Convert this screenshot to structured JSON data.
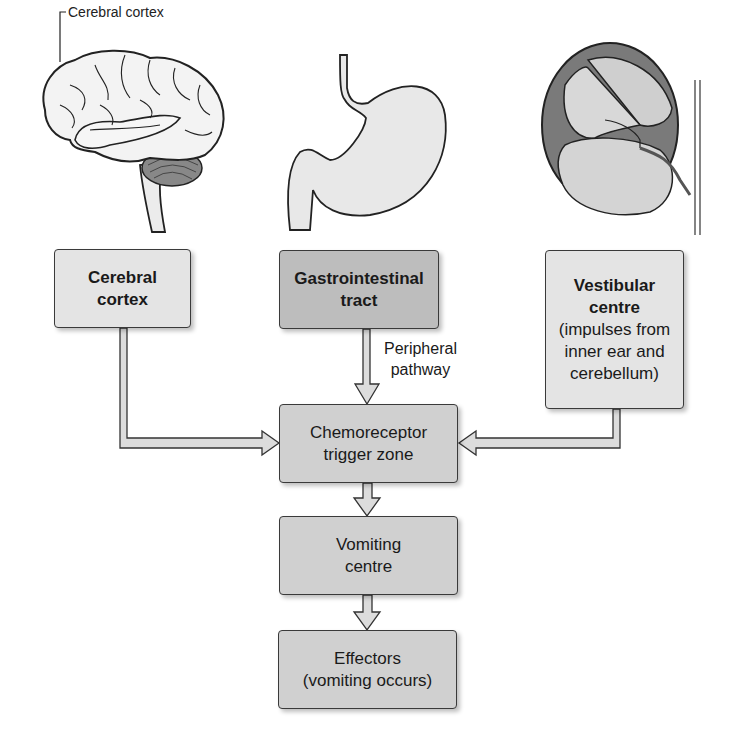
{
  "illustrations": {
    "brain": {
      "label": "Cerebral cortex"
    },
    "stomach": {},
    "inner_ear": {}
  },
  "boxes": {
    "cerebral_cortex": {
      "title_line1": "Cerebral",
      "title_line2": "cortex"
    },
    "gi_tract": {
      "title_line1": "Gastrointestinal",
      "title_line2": "tract"
    },
    "vestibular": {
      "title_line1": "Vestibular",
      "title_line2": "centre",
      "desc_line1": "(impulses from",
      "desc_line2": "inner ear and",
      "desc_line3": "cerebellum)"
    },
    "chemoreceptor": {
      "line1": "Chemoreceptor",
      "line2": "trigger zone"
    },
    "vomiting_centre": {
      "line1": "Vomiting",
      "line2": "centre"
    },
    "effectors": {
      "line1": "Effectors",
      "line2": "(vomiting occurs)"
    }
  },
  "arrow_labels": {
    "peripheral_line1": "Peripheral",
    "peripheral_line2": "pathway"
  },
  "colors": {
    "box_light": "#e4e4e4",
    "box_mid": "#d0d0d0",
    "box_dark": "#bdbdbd",
    "outline": "#3a3a3a"
  }
}
